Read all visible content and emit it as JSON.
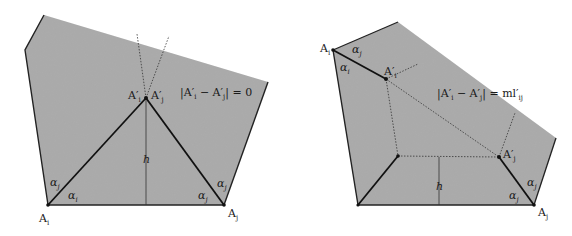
{
  "colors": {
    "fill": "#a9a9a9",
    "edge": "#222222",
    "background": "#ffffff"
  },
  "left_panel": {
    "equation": {
      "lhs": "|A′",
      "sub_i": "i",
      "minus": " − A′",
      "sub_j": "j",
      "rhs": "| = 0"
    },
    "labels": {
      "apex_i": "A′",
      "apex_i_sub": "i",
      "apex_j": "A′",
      "apex_j_sub": "j",
      "height": "h",
      "vertex_i": "A",
      "vertex_i_sub": "i",
      "vertex_j": "A",
      "vertex_j_sub": "j",
      "alpha_j_left": "α",
      "alpha_j_left_sub": "j",
      "alpha_i_left": "α",
      "alpha_i_left_sub": "i",
      "alpha_j_right_low": "α",
      "alpha_j_right_low_sub": "j",
      "alpha_j_right_high": "α",
      "alpha_j_right_high_sub": "j"
    }
  },
  "right_panel": {
    "equation": {
      "lhs": "|A′",
      "sub_i": "i",
      "minus": " − A′",
      "sub_j": "j",
      "rhs": "| = ml′",
      "rhs_sub": "ij"
    },
    "labels": {
      "vertex_i": "A",
      "vertex_i_sub": "i",
      "alpha_j_top": "α",
      "alpha_j_top_sub": "j",
      "alpha_i_top": "α",
      "alpha_i_top_sub": "i",
      "apex_i": "A′",
      "apex_i_sub": "i",
      "apex_j": "A′",
      "apex_j_sub": "j",
      "height": "h",
      "vertex_j": "A",
      "vertex_j_sub": "j",
      "alpha_j_right_high": "α",
      "alpha_j_right_high_sub": "j",
      "alpha_j_right_low": "α",
      "alpha_j_right_low_sub": "j"
    }
  }
}
